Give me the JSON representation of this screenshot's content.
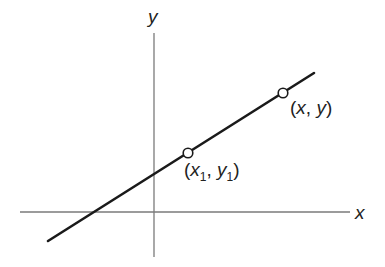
{
  "diagram": {
    "type": "coordinate-line-point-slope",
    "colors": {
      "axis": "#777777",
      "line": "#1a1a1a",
      "text": "#222222",
      "point_fill": "#ffffff"
    },
    "axes": {
      "x_label": "x",
      "y_label": "y"
    },
    "points": [
      {
        "id": "p1",
        "label_open": "(",
        "var1": "x",
        "sub1": "1",
        "sep": ", ",
        "var2": "y",
        "sub2": "1",
        "label_close": ")"
      },
      {
        "id": "p2",
        "label_open": "(",
        "var1": "x",
        "sep": ", ",
        "var2": "y",
        "label_close": ")"
      }
    ]
  }
}
